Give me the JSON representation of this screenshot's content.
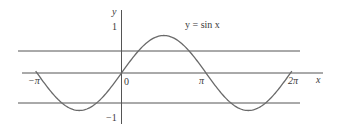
{
  "chart_data": {
    "type": "line",
    "title": "",
    "annotation": "y = sin x",
    "xlabel": "x",
    "ylabel": "y",
    "function": "sin(x)",
    "x_range": [
      -3.14159,
      6.28318
    ],
    "xlim": [
      -3.5,
      7.5
    ],
    "ylim": [
      -1.4,
      1.8
    ],
    "x_ticks": [
      {
        "value": -3.14159,
        "label": "−π"
      },
      {
        "value": 0,
        "label": "0"
      },
      {
        "value": 3.14159,
        "label": "π"
      },
      {
        "value": 6.28318,
        "label": "2π"
      }
    ],
    "y_ticks": [
      {
        "value": 1,
        "label": "1"
      },
      {
        "value": -1,
        "label": "−1"
      }
    ],
    "horizontal_lines": [
      0.6,
      0,
      -0.8
    ],
    "series": [
      {
        "name": "y = sin x",
        "x": [
          -3.1416,
          -2.3562,
          -1.5708,
          -0.7854,
          0,
          0.7854,
          1.5708,
          2.3562,
          3.1416,
          3.927,
          4.7124,
          5.4978,
          6.2832
        ],
        "values": [
          0,
          -0.7071,
          -1,
          -0.7071,
          0,
          0.7071,
          1,
          0.7071,
          0,
          -0.7071,
          -1,
          -0.7071,
          0
        ]
      }
    ],
    "grid": false,
    "legend": "none"
  },
  "labels": {
    "y_axis": "y",
    "x_axis": "x",
    "y_one": "1",
    "y_minus_one": "−1",
    "origin": "0",
    "neg_pi": "−π",
    "pi": "π",
    "two_pi": "2π",
    "function_label": "y = sin x"
  },
  "colors": {
    "axis": "#555555",
    "curve": "#6a6a6a",
    "text": "#3a3a3a"
  }
}
